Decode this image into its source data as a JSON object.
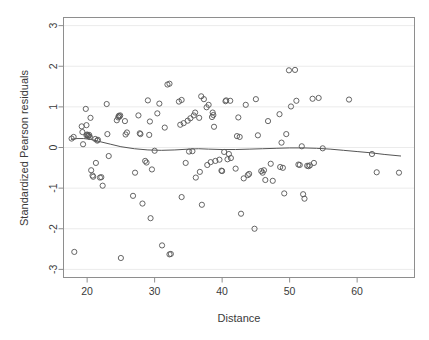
{
  "chart_data": {
    "type": "scatter",
    "title": "",
    "xlabel": "Distance",
    "ylabel": "Standardized Pearson residuals",
    "xlim": [
      16.5,
      68.5
    ],
    "ylim": [
      -3.2,
      3.2
    ],
    "xticks": [
      20,
      30,
      40,
      50,
      60
    ],
    "yticks": [
      3,
      2,
      1,
      0,
      -1,
      -2,
      -3
    ],
    "grid": true,
    "grid_orientation": "horizontal",
    "legend": "none",
    "point_marker": "open-circle",
    "point_color": "#555555",
    "smoother": {
      "name": "lowess",
      "color": "#555555",
      "points": [
        [
          17.6,
          0.2
        ],
        [
          18.5,
          0.22
        ],
        [
          19.5,
          0.22
        ],
        [
          20.5,
          0.2
        ],
        [
          21.5,
          0.16
        ],
        [
          22.5,
          0.12
        ],
        [
          23.5,
          0.08
        ],
        [
          25.0,
          0.02
        ],
        [
          27.0,
          -0.03
        ],
        [
          29.0,
          -0.06
        ],
        [
          31.0,
          -0.07
        ],
        [
          33.0,
          -0.06
        ],
        [
          35.0,
          -0.04
        ],
        [
          36.5,
          -0.03
        ],
        [
          38.0,
          -0.04
        ],
        [
          40.0,
          -0.05
        ],
        [
          42.0,
          -0.05
        ],
        [
          44.0,
          -0.04
        ],
        [
          46.0,
          -0.03
        ],
        [
          48.0,
          -0.02
        ],
        [
          50.0,
          -0.01
        ],
        [
          52.0,
          -0.01
        ],
        [
          54.0,
          -0.02
        ],
        [
          56.0,
          -0.04
        ],
        [
          58.0,
          -0.07
        ],
        [
          60.0,
          -0.1
        ],
        [
          62.0,
          -0.13
        ],
        [
          64.0,
          -0.17
        ],
        [
          66.5,
          -0.21
        ]
      ]
    },
    "points": [
      [
        17.7,
        0.22
      ],
      [
        18.0,
        0.26
      ],
      [
        18.1,
        -2.57
      ],
      [
        19.2,
        0.52
      ],
      [
        19.3,
        0.38
      ],
      [
        19.4,
        0.08
      ],
      [
        19.8,
        0.95
      ],
      [
        19.9,
        0.55
      ],
      [
        19.9,
        0.3
      ],
      [
        20.0,
        0.32
      ],
      [
        20.1,
        0.3
      ],
      [
        20.2,
        0.28
      ],
      [
        20.3,
        0.31
      ],
      [
        20.4,
        0.26
      ],
      [
        20.5,
        0.73
      ],
      [
        20.6,
        -0.56
      ],
      [
        20.8,
        -0.69
      ],
      [
        20.9,
        -0.72
      ],
      [
        21.2,
        0.21
      ],
      [
        21.3,
        -0.38
      ],
      [
        21.5,
        0.17
      ],
      [
        21.6,
        0.19
      ],
      [
        21.9,
        -0.74
      ],
      [
        22.1,
        -0.73
      ],
      [
        22.3,
        -0.94
      ],
      [
        22.9,
        1.07
      ],
      [
        23.0,
        0.33
      ],
      [
        23.2,
        -0.21
      ],
      [
        24.4,
        0.67
      ],
      [
        24.6,
        0.74
      ],
      [
        24.7,
        0.78
      ],
      [
        24.8,
        0.76
      ],
      [
        24.9,
        0.79
      ],
      [
        25.0,
        -2.72
      ],
      [
        25.6,
        0.65
      ],
      [
        25.7,
        0.32
      ],
      [
        25.9,
        0.37
      ],
      [
        26.8,
        -1.19
      ],
      [
        27.1,
        -0.62
      ],
      [
        27.6,
        0.79
      ],
      [
        27.8,
        0.35
      ],
      [
        27.9,
        0.33
      ],
      [
        28.2,
        -1.38
      ],
      [
        28.6,
        -0.33
      ],
      [
        28.8,
        -0.37
      ],
      [
        29.0,
        1.16
      ],
      [
        29.2,
        0.31
      ],
      [
        29.3,
        0.64
      ],
      [
        29.4,
        -1.74
      ],
      [
        29.6,
        -0.54
      ],
      [
        30.0,
        -0.08
      ],
      [
        30.4,
        0.84
      ],
      [
        30.7,
        1.08
      ],
      [
        31.1,
        -2.41
      ],
      [
        31.5,
        0.49
      ],
      [
        31.9,
        1.55
      ],
      [
        32.2,
        1.57
      ],
      [
        32.2,
        -2.63
      ],
      [
        32.4,
        -2.62
      ],
      [
        33.6,
        1.13
      ],
      [
        33.8,
        0.56
      ],
      [
        34.0,
        1.17
      ],
      [
        34.0,
        -1.22
      ],
      [
        34.3,
        0.6
      ],
      [
        34.6,
        -0.38
      ],
      [
        34.9,
        0.66
      ],
      [
        35.1,
        -0.1
      ],
      [
        35.3,
        0.72
      ],
      [
        35.6,
        -0.09
      ],
      [
        35.8,
        0.79
      ],
      [
        36.0,
        0.86
      ],
      [
        36.1,
        -0.74
      ],
      [
        36.6,
        0.73
      ],
      [
        36.7,
        -0.6
      ],
      [
        36.9,
        1.26
      ],
      [
        37.0,
        -1.41
      ],
      [
        37.3,
        1.19
      ],
      [
        37.7,
        0.99
      ],
      [
        37.8,
        -0.43
      ],
      [
        38.0,
        1.05
      ],
      [
        38.3,
        -0.36
      ],
      [
        38.5,
        0.75
      ],
      [
        38.6,
        0.86
      ],
      [
        38.7,
        0.8
      ],
      [
        38.8,
        0.51
      ],
      [
        39.0,
        -0.33
      ],
      [
        39.6,
        -0.3
      ],
      [
        39.9,
        -0.57
      ],
      [
        40.0,
        -0.58
      ],
      [
        40.3,
        -0.11
      ],
      [
        40.5,
        1.14
      ],
      [
        40.6,
        1.16
      ],
      [
        40.8,
        -0.29
      ],
      [
        41.0,
        -0.16
      ],
      [
        41.2,
        1.15
      ],
      [
        41.3,
        -0.26
      ],
      [
        42.0,
        -0.52
      ],
      [
        42.2,
        0.28
      ],
      [
        42.4,
        0.74
      ],
      [
        42.6,
        0.26
      ],
      [
        42.8,
        -1.63
      ],
      [
        43.2,
        -0.76
      ],
      [
        43.5,
        1.05
      ],
      [
        43.8,
        -0.68
      ],
      [
        44.0,
        -0.65
      ],
      [
        44.8,
        -2.0
      ],
      [
        45.0,
        1.19
      ],
      [
        45.3,
        0.3
      ],
      [
        45.8,
        -0.58
      ],
      [
        46.0,
        -0.62
      ],
      [
        46.2,
        -0.56
      ],
      [
        46.4,
        -0.8
      ],
      [
        46.8,
        0.65
      ],
      [
        47.2,
        -0.4
      ],
      [
        47.5,
        -0.82
      ],
      [
        48.5,
        0.82
      ],
      [
        48.6,
        -0.48
      ],
      [
        48.8,
        0.12
      ],
      [
        49.0,
        -0.5
      ],
      [
        49.2,
        -1.13
      ],
      [
        49.5,
        0.33
      ],
      [
        49.9,
        1.9
      ],
      [
        50.2,
        1.01
      ],
      [
        50.8,
        1.91
      ],
      [
        51.0,
        1.15
      ],
      [
        51.3,
        -0.42
      ],
      [
        51.5,
        -0.43
      ],
      [
        51.8,
        0.03
      ],
      [
        52.0,
        -1.15
      ],
      [
        52.2,
        -1.26
      ],
      [
        52.6,
        -0.45
      ],
      [
        52.8,
        -0.46
      ],
      [
        53.0,
        -0.44
      ],
      [
        53.4,
        1.2
      ],
      [
        53.6,
        -0.38
      ],
      [
        54.3,
        1.22
      ],
      [
        54.9,
        -0.02
      ],
      [
        58.8,
        1.18
      ],
      [
        62.2,
        -0.16
      ],
      [
        62.9,
        -0.61
      ],
      [
        66.2,
        -0.62
      ]
    ]
  }
}
